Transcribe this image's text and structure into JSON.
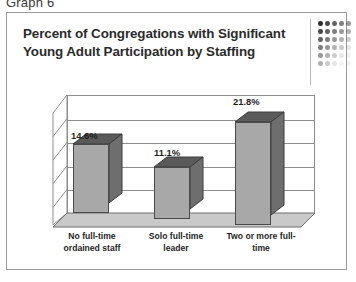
{
  "caption": "Graph 6",
  "card": {
    "title": "Percent of Congregations with Significant Young Adult Participation by Staffing",
    "decoration": "dot-matrix-grid"
  },
  "chart_data": {
    "type": "bar",
    "title": "Percent of Congregations with Significant Young Adult Participation by Staffing",
    "categories": [
      "No full-time ordained staff",
      "Solo full-time leader",
      "Two or more full-time"
    ],
    "values": [
      14.6,
      11.1,
      21.8
    ],
    "data_labels": [
      "14.6%",
      "11.1%",
      "21.8%"
    ],
    "xlabel": "",
    "ylabel": "",
    "ylim": [
      0,
      25
    ],
    "gridlines": 5,
    "grid": true,
    "legend": "none",
    "style": "3d-column",
    "colors": {
      "bar_front": "#a8a8a8",
      "bar_side": "#6e6e6e",
      "bar_top": "#5a5a5a",
      "outline": "#4a4a4a",
      "axis": "#8d8d8d",
      "floor": "#c9c9c9",
      "text": "#1f1f1f",
      "card_border": "#9a9a9a"
    }
  }
}
